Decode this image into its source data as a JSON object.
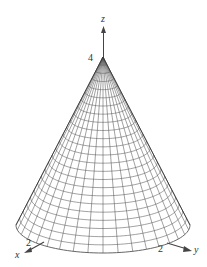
{
  "figure": {
    "type": "3d-surface-wireframe",
    "axes": {
      "z": {
        "label": "z",
        "tick": "4"
      },
      "x": {
        "label": "x",
        "tick": "2"
      },
      "y": {
        "label": "y",
        "tick": "2"
      }
    },
    "surface": {
      "apex": [
        103,
        57
      ],
      "base_center": [
        103,
        225
      ],
      "base_rx": 87,
      "base_ry": 28,
      "meridians": 36,
      "rings": 24,
      "line_color": "#555555"
    }
  }
}
